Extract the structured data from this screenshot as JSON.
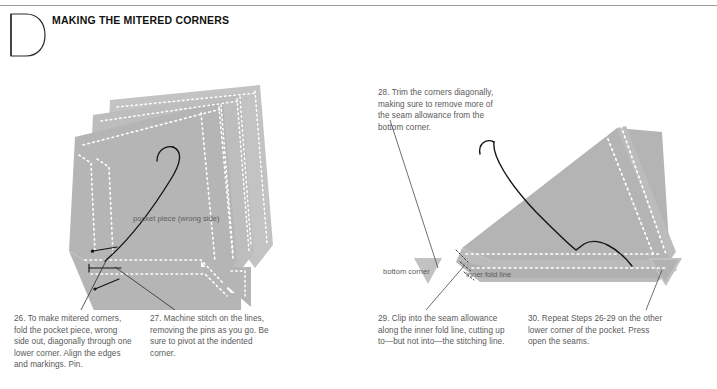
{
  "page": {
    "section_letter": "D",
    "header_title": "MAKING THE MITERED CORNERS",
    "ink_color": "#1a1a1a",
    "fabric_gray": "#b4b4b4",
    "fabric_gray_light": "#c4c4c4",
    "fabric_gray_dark": "#a6a6a6",
    "caption_color": "#595959",
    "rule_color": "#9a9a9a",
    "stitch_dash_color": "#ffffff"
  },
  "figures": {
    "left": {
      "name": "mitered-corner-folded-and-pinned",
      "labels": {
        "pocket_piece": "pocket piece (wrong side)"
      }
    },
    "right": {
      "name": "mitered-corner-trimmed-and-clipped",
      "labels": {
        "bottom_corner": "bottom corner",
        "inner_fold_line": "inner fold line"
      }
    }
  },
  "steps": [
    {
      "number": "26.",
      "text": "26. To make mitered corners, fold the pocket piece, wrong side out, diagonally through one lower corner. Align the edges and markings. Pin."
    },
    {
      "number": "27.",
      "text": "27. Machine stitch on the lines, removing the pins as you go. Be sure to pivot at the indented corner."
    },
    {
      "number": "28.",
      "text": "28. Trim the corners diagonally, making sure to remove more of the seam allowance from the bottom corner."
    },
    {
      "number": "29.",
      "text": "29. Clip into the seam allowance along the inner fold line, cutting up to—but not into—the stitching line."
    },
    {
      "number": "30.",
      "text": "30. Repeat Steps 26-29 on the other lower corner of the pocket. Press open the seams."
    }
  ]
}
